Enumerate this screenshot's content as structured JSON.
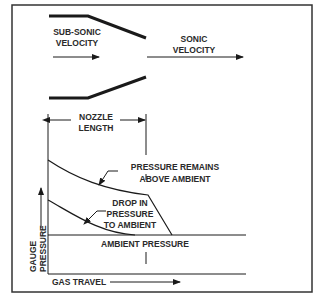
{
  "diagram": {
    "nozzle": {
      "inlet_label_line1": "SUB-SONIC",
      "inlet_label_line2": "VELOCITY",
      "outlet_label_line1": "SONIC",
      "outlet_label_line2": "VELOCITY"
    },
    "dimension": {
      "label_line1": "NOZZLE",
      "label_line2": "LENGTH"
    },
    "graph": {
      "y_axis_label_line1": "GAUGE",
      "y_axis_label_line2": "PRESSURE",
      "x_axis_label": "GAS TRAVEL",
      "upper_curve_label_line1": "PRESSURE REMAINS",
      "upper_curve_label_line2": "ABOVE AMBIENT",
      "lower_curve_label_line1": "DROP IN",
      "lower_curve_label_line2": "PRESSURE",
      "lower_curve_label_line3": "TO AMBIENT",
      "ambient_label": "AMBIENT PRESSURE"
    },
    "colors": {
      "line": "#1a1a1a",
      "frame": "#333333",
      "background": "#ffffff"
    }
  }
}
